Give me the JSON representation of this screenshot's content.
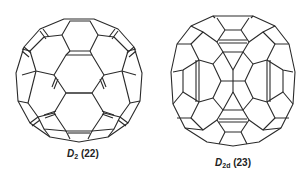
{
  "figure": {
    "structures": [
      {
        "id": "left",
        "symmetry_main": "D",
        "symmetry_sub": "2",
        "compound_number": "(22)",
        "description": "Fullerene cage projection with D2 symmetry"
      },
      {
        "id": "right",
        "symmetry_main": "D",
        "symmetry_sub": "2d",
        "compound_number": "(23)",
        "description": "Fullerene cage projection with D2d symmetry"
      }
    ],
    "colors": {
      "line": "#2a2a2a",
      "background": "#ffffff"
    }
  }
}
